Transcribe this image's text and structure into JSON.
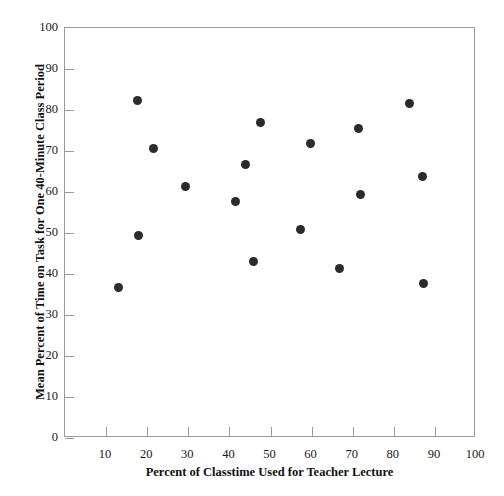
{
  "chart_data": {
    "type": "scatter",
    "title": "",
    "xlabel": "Percent of Classtime Used for Teacher Lecture",
    "ylabel": "Mean Percent of Time on Task for One 40-Minute Class Period",
    "xlim": [
      0,
      100
    ],
    "ylim": [
      0,
      100
    ],
    "xticks": [
      10,
      20,
      30,
      40,
      50,
      60,
      70,
      80,
      90,
      100
    ],
    "yticks": [
      0,
      10,
      20,
      30,
      40,
      50,
      60,
      70,
      80,
      90,
      100
    ],
    "grid": false,
    "legend": null,
    "marker_color": "#2b2b2b",
    "frame_color": "#9a9a9a",
    "points": [
      {
        "x": 12.9,
        "y": 36.6
      },
      {
        "x": 17.6,
        "y": 82.4
      },
      {
        "x": 17.8,
        "y": 49.3
      },
      {
        "x": 21.5,
        "y": 70.6
      },
      {
        "x": 29.3,
        "y": 61.3
      },
      {
        "x": 41.5,
        "y": 57.8
      },
      {
        "x": 43.8,
        "y": 66.8
      },
      {
        "x": 45.9,
        "y": 43.0
      },
      {
        "x": 47.6,
        "y": 76.9
      },
      {
        "x": 57.3,
        "y": 50.9
      },
      {
        "x": 59.7,
        "y": 71.9
      },
      {
        "x": 66.8,
        "y": 41.3
      },
      {
        "x": 71.5,
        "y": 75.4
      },
      {
        "x": 72.0,
        "y": 59.3
      },
      {
        "x": 83.9,
        "y": 81.6
      },
      {
        "x": 86.9,
        "y": 63.9
      },
      {
        "x": 87.3,
        "y": 37.8
      }
    ]
  }
}
